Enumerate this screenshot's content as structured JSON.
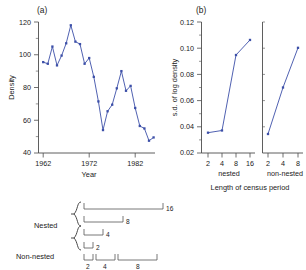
{
  "figure": {
    "panel_a_label": "(a)",
    "panel_b_label": "(b)"
  },
  "chart_data": [
    {
      "type": "line",
      "panel": "(a)",
      "title": "",
      "xlabel": "Year",
      "ylabel": "Density",
      "xlim": [
        1961,
        1986
      ],
      "ylim": [
        40,
        120
      ],
      "xticks": [
        1962,
        1972,
        1982
      ],
      "xticklabels": [
        "1962",
        "1972",
        "1982"
      ],
      "yticks": [
        40,
        60,
        80,
        100,
        120
      ],
      "yticklabels": [
        "40",
        "60",
        "80",
        "100",
        "120"
      ],
      "grid": false,
      "legend": "none",
      "marker": "square",
      "color": "#3c4fa8",
      "x": [
        1962,
        1963,
        1964,
        1965,
        1966,
        1967,
        1968,
        1969,
        1970,
        1971,
        1972,
        1973,
        1974,
        1975,
        1976,
        1977,
        1978,
        1979,
        1980,
        1981,
        1982,
        1983,
        1984,
        1985
      ],
      "values": [
        95.5,
        94.5,
        105.0,
        93.5,
        99.5,
        107.0,
        118.0,
        108.0,
        106.5,
        94.5,
        98.0,
        86.5,
        71.5,
        54.0,
        65.5,
        69.5,
        79.5,
        90.0,
        78.0,
        81.0,
        67.5,
        56.5,
        55.0,
        47.5,
        49.5
      ]
    },
    {
      "type": "line",
      "panel": "(b)",
      "title": "",
      "xlabel": "Length of census period",
      "ylabel": "s.d. of log density",
      "ylim": [
        0.02,
        0.12
      ],
      "yticks": [
        0.02,
        0.04,
        0.06,
        0.08,
        0.1,
        0.12
      ],
      "yticklabels": [
        "0.02",
        "0.04",
        "0.06",
        "0.08",
        "0.10",
        "0.12"
      ],
      "grid": false,
      "legend": "none",
      "marker": "square",
      "color": "#3c4fa8",
      "subpanels": [
        {
          "name": "nested",
          "xticks": [
            2,
            4,
            8,
            16
          ],
          "xticklabels": [
            "2",
            "4",
            "8",
            "16"
          ],
          "x": [
            2,
            4,
            8,
            16
          ],
          "values": [
            0.0355,
            0.0372,
            0.0948,
            0.1063
          ]
        },
        {
          "name": "non-nested",
          "xticks": [
            2,
            4,
            8
          ],
          "xticklabels": [
            "2",
            "4",
            "8"
          ],
          "x": [
            2,
            4,
            8
          ],
          "values": [
            0.0345,
            0.07,
            0.1003
          ]
        }
      ]
    }
  ],
  "schematic": {
    "nested_label": "Nested",
    "nonnested_label": "Non-nested",
    "nested_rows": [
      {
        "label": "16",
        "span": 16
      },
      {
        "label": "8",
        "span": 8
      },
      {
        "label": "4",
        "span": 4
      },
      {
        "label": "2",
        "span": 2
      }
    ],
    "nonnested_segments": [
      {
        "label": "2",
        "span": 2
      },
      {
        "label": "4",
        "span": 4
      },
      {
        "label": "8",
        "span": 8
      }
    ]
  }
}
